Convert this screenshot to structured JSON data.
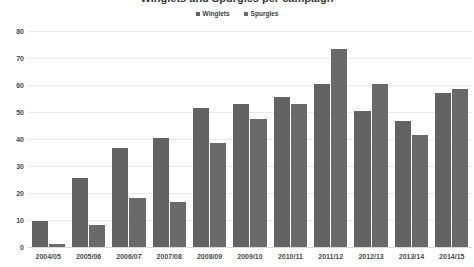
{
  "chart_data": {
    "type": "bar",
    "title": "Winglets and Spurgles per campaign",
    "xlabel": "",
    "ylabel": "",
    "ylim": [
      0,
      80
    ],
    "yticks": [
      0,
      10,
      20,
      30,
      40,
      50,
      60,
      70,
      80
    ],
    "grid": true,
    "legend_position": "top-center",
    "categories": [
      "2004/05",
      "2005/06",
      "2006/07",
      "2007/08",
      "2008/09",
      "2009/10",
      "2010/11",
      "2011/12",
      "2012/13",
      "2013/14",
      "2014/15"
    ],
    "series": [
      {
        "name": "Winglets",
        "color": "#636363",
        "values": [
          9.5,
          25.5,
          36.5,
          40.5,
          51.5,
          53,
          55.5,
          60.5,
          50.5,
          46.5,
          57
        ]
      },
      {
        "name": "Spurgles",
        "color": "#6a6a6a",
        "values": [
          1,
          8,
          18,
          16.5,
          38.5,
          47.5,
          53,
          73.5,
          60.5,
          41.5,
          58.5
        ]
      }
    ]
  },
  "colors": {
    "bar_series_1": "#636363",
    "bar_series_2": "#6a6a6a",
    "gridline": "#e9e9e9",
    "baseline": "#d9d9d9",
    "text": "#4a4a4a",
    "background": "#ffffff"
  }
}
